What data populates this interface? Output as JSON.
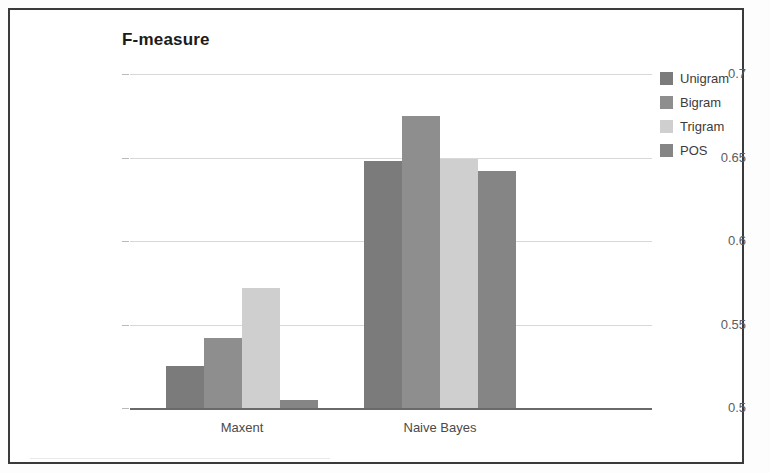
{
  "chart_data": {
    "type": "bar",
    "title": "F-measure",
    "xlabel": "",
    "ylabel": "",
    "categories": [
      "Maxent",
      "Naive Bayes"
    ],
    "series": [
      {
        "name": "Unigram",
        "color": "#7b7b7b",
        "values": [
          0.525,
          0.648
        ]
      },
      {
        "name": "Bigram",
        "color": "#8e8e8e",
        "values": [
          0.542,
          0.675
        ]
      },
      {
        "name": "Trigram",
        "color": "#cfcfcf",
        "values": [
          0.572,
          0.649
        ]
      },
      {
        "name": "POS",
        "color": "#858585",
        "values": [
          0.505,
          0.642
        ]
      }
    ],
    "ylim": [
      0.5,
      0.7
    ],
    "yticks": [
      0.5,
      0.55,
      0.6,
      0.65,
      0.7
    ],
    "ytick_labels": [
      "0.5",
      "0.55",
      "0.6",
      "0.65",
      "0.7"
    ],
    "grid": true,
    "legend_position": "right",
    "legend_entries": [
      "Unigram",
      "Bigram",
      "Trigram",
      "POS"
    ],
    "bar_gap_within_group": 0,
    "background_color": "#ffffff",
    "gridline_color": "#d8d8d8",
    "axis_color": "#6a6a6a",
    "border_color": "#3a3a3a"
  }
}
